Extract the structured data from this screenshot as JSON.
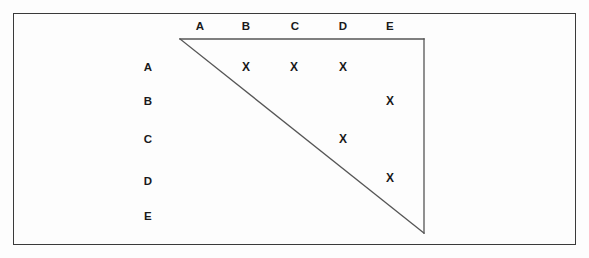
{
  "figure": {
    "type": "matrix-with-triangle-overlay",
    "background_color": "#fdfdfd",
    "border_color": "#3a3a3a",
    "ink_color": "#1a1a1a",
    "mark_glyph": "X",
    "column_headers": [
      {
        "label": "A",
        "x": 200,
        "y": 26
      },
      {
        "label": "B",
        "x": 246,
        "y": 26
      },
      {
        "label": "C",
        "x": 295,
        "y": 26
      },
      {
        "label": "D",
        "x": 343,
        "y": 26
      },
      {
        "label": "E",
        "x": 390,
        "y": 26
      }
    ],
    "row_headers": [
      {
        "label": "A",
        "x": 148,
        "y": 67
      },
      {
        "label": "B",
        "x": 148,
        "y": 101
      },
      {
        "label": "C",
        "x": 148,
        "y": 139
      },
      {
        "label": "D",
        "x": 148,
        "y": 181
      },
      {
        "label": "E",
        "x": 148,
        "y": 216
      }
    ],
    "marks": [
      {
        "row": "A",
        "col": "B",
        "x": 246,
        "y": 67
      },
      {
        "row": "A",
        "col": "C",
        "x": 294,
        "y": 67
      },
      {
        "row": "A",
        "col": "D",
        "x": 343,
        "y": 67
      },
      {
        "row": "B",
        "col": "E",
        "x": 390,
        "y": 101
      },
      {
        "row": "C",
        "col": "D",
        "x": 343,
        "y": 139
      },
      {
        "row": "D",
        "col": "E",
        "x": 390,
        "y": 178
      }
    ],
    "triangle": {
      "apex_x": 180,
      "apex_y": 39,
      "top_right_x": 424,
      "top_right_y": 39,
      "bottom_right_x": 424,
      "bottom_right_y": 233,
      "stroke": "#555555",
      "stroke_width": 1.3
    },
    "outer_rect": {
      "x": 13,
      "y": 13,
      "width": 563,
      "height": 232
    }
  }
}
